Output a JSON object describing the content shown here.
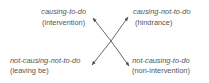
{
  "diagram": {
    "quadrants": {
      "top_left": {
        "term": "causing-to-do",
        "gloss": "(intervention)"
      },
      "top_right": {
        "term": "causing-not-to-do",
        "gloss": "(hindrance)"
      },
      "bottom_left": {
        "term": "not-causing-not-to-do",
        "gloss": "(leaving be)"
      },
      "bottom_right": {
        "term": "not-causing-to-do",
        "gloss": "(non-intervention)"
      }
    },
    "arrows": [
      {
        "from": "center",
        "to": "top_left"
      },
      {
        "from": "center",
        "to": "top_right"
      },
      {
        "from": "center",
        "to": "bottom_left"
      },
      {
        "from": "center",
        "to": "bottom_right"
      }
    ],
    "colors": {
      "text": "#555555",
      "arrow": "#555555",
      "background": "#ffffff"
    }
  }
}
